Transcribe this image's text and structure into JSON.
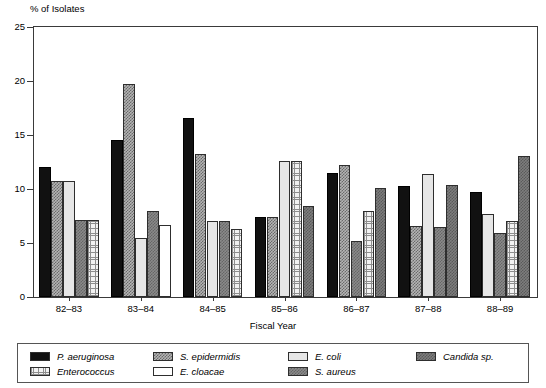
{
  "chart_data": {
    "type": "bar",
    "title": "",
    "ylabel": "% of Isolates",
    "xlabel": "Fiscal Year",
    "ylim": [
      0,
      25
    ],
    "yticks": [
      0,
      5,
      10,
      15,
      20,
      25
    ],
    "grid": false,
    "legend_position": "bottom",
    "categories": [
      "82–83",
      "83–84",
      "84–85",
      "85–86",
      "86–87",
      "87–88",
      "88–89"
    ],
    "series": [
      {
        "name": "P. aeruginosa",
        "values": [
          12.0,
          14.5,
          16.6,
          7.4,
          11.5,
          10.3,
          9.7
        ]
      },
      {
        "name": "S. epidermidis",
        "values": [
          10.7,
          19.7,
          13.2,
          7.4,
          12.2,
          6.6,
          null
        ]
      },
      {
        "name": "E. coli",
        "values": [
          10.7,
          5.5,
          7.0,
          12.6,
          null,
          11.4,
          7.7
        ]
      },
      {
        "name": "S. aureus",
        "values": [
          7.1,
          8.0,
          7.0,
          null,
          5.2,
          6.5,
          5.9
        ]
      },
      {
        "name": "Enterococcus",
        "values": [
          7.1,
          null,
          6.3,
          12.6,
          8.0,
          null,
          7.0
        ]
      },
      {
        "name": "E. cloacae",
        "values": [
          null,
          6.7,
          null,
          null,
          null,
          null,
          null
        ]
      },
      {
        "name": "Candida sp.",
        "values": [
          null,
          null,
          null,
          8.4,
          10.1,
          10.4,
          13.1
        ]
      }
    ],
    "groups": [
      {
        "label": "82–83",
        "bars": [
          {
            "series": "P. aeruginosa",
            "value": 12.0,
            "pattern": "solidblack"
          },
          {
            "series": "S. epidermidis",
            "value": 10.7,
            "pattern": "checkmid"
          },
          {
            "series": "E. coli",
            "value": 10.7,
            "pattern": "lightgray"
          },
          {
            "series": "S. aureus",
            "value": 7.1,
            "pattern": "darkgray"
          },
          {
            "series": "Enterococcus",
            "value": 7.1,
            "pattern": "grid"
          }
        ]
      },
      {
        "label": "83–84",
        "bars": [
          {
            "series": "P. aeruginosa",
            "value": 14.5,
            "pattern": "solidblack"
          },
          {
            "series": "S. epidermidis",
            "value": 19.7,
            "pattern": "checkmid"
          },
          {
            "series": "E. coli",
            "value": 5.5,
            "pattern": "lightgray"
          },
          {
            "series": "S. aureus",
            "value": 8.0,
            "pattern": "darkgray"
          },
          {
            "series": "E. cloacae",
            "value": 6.7,
            "pattern": "white"
          }
        ]
      },
      {
        "label": "84–85",
        "bars": [
          {
            "series": "P. aeruginosa",
            "value": 16.6,
            "pattern": "solidblack"
          },
          {
            "series": "S. epidermidis",
            "value": 13.2,
            "pattern": "checkmid"
          },
          {
            "series": "E. coli",
            "value": 7.0,
            "pattern": "lightgray"
          },
          {
            "series": "S. aureus",
            "value": 7.0,
            "pattern": "darkgray"
          },
          {
            "series": "Enterococcus",
            "value": 6.3,
            "pattern": "grid"
          }
        ]
      },
      {
        "label": "85–86",
        "bars": [
          {
            "series": "P. aeruginosa",
            "value": 7.4,
            "pattern": "solidblack"
          },
          {
            "series": "S. epidermidis",
            "value": 7.4,
            "pattern": "checkmid"
          },
          {
            "series": "E. coli",
            "value": 12.6,
            "pattern": "lightgray"
          },
          {
            "series": "Enterococcus",
            "value": 12.6,
            "pattern": "grid"
          },
          {
            "series": "Candida sp.",
            "value": 8.4,
            "pattern": "candida"
          }
        ]
      },
      {
        "label": "86–87",
        "bars": [
          {
            "series": "P. aeruginosa",
            "value": 11.5,
            "pattern": "solidblack"
          },
          {
            "series": "S. epidermidis",
            "value": 12.2,
            "pattern": "checkmid"
          },
          {
            "series": "S. aureus",
            "value": 5.2,
            "pattern": "darkgray"
          },
          {
            "series": "Enterococcus",
            "value": 8.0,
            "pattern": "grid"
          },
          {
            "series": "Candida sp.",
            "value": 10.1,
            "pattern": "candida"
          }
        ]
      },
      {
        "label": "87–88",
        "bars": [
          {
            "series": "P. aeruginosa",
            "value": 10.3,
            "pattern": "solidblack"
          },
          {
            "series": "S. epidermidis",
            "value": 6.6,
            "pattern": "checkmid"
          },
          {
            "series": "E. coli",
            "value": 11.4,
            "pattern": "lightgray"
          },
          {
            "series": "S. aureus",
            "value": 6.5,
            "pattern": "darkgray"
          },
          {
            "series": "Candida sp.",
            "value": 10.4,
            "pattern": "candida"
          }
        ]
      },
      {
        "label": "88–89",
        "bars": [
          {
            "series": "P. aeruginosa",
            "value": 9.7,
            "pattern": "solidblack"
          },
          {
            "series": "E. coli",
            "value": 7.7,
            "pattern": "lightgray"
          },
          {
            "series": "S. aureus",
            "value": 5.9,
            "pattern": "darkgray"
          },
          {
            "series": "Enterococcus",
            "value": 7.0,
            "pattern": "grid"
          },
          {
            "series": "Candida sp.",
            "value": 13.1,
            "pattern": "candida"
          }
        ]
      }
    ],
    "legend": [
      {
        "label": "P. aeruginosa",
        "pattern": "solidblack",
        "col": 0,
        "row": 0
      },
      {
        "label": "Enterococcus",
        "pattern": "grid",
        "col": 0,
        "row": 1
      },
      {
        "label": "S. epidermidis",
        "pattern": "checkmid",
        "col": 1,
        "row": 0
      },
      {
        "label": "E. cloacae",
        "pattern": "white",
        "col": 1,
        "row": 1
      },
      {
        "label": "E. coli",
        "pattern": "lightgray",
        "col": 2,
        "row": 0
      },
      {
        "label": "S. aureus",
        "pattern": "darkgray",
        "col": 2,
        "row": 1
      },
      {
        "label": "Candida sp.",
        "pattern": "candida",
        "col": 3,
        "row": 0
      }
    ],
    "colors": {
      "solidblack": "#111111",
      "checkmid": "#b4b4b4",
      "lightgray": "#e6e6e6",
      "white": "#ffffff",
      "darkgray": "#8a8a8a",
      "grid": "#f2f2f2",
      "candida": "#7d7d7d",
      "axis": "#3a3a3a"
    }
  }
}
